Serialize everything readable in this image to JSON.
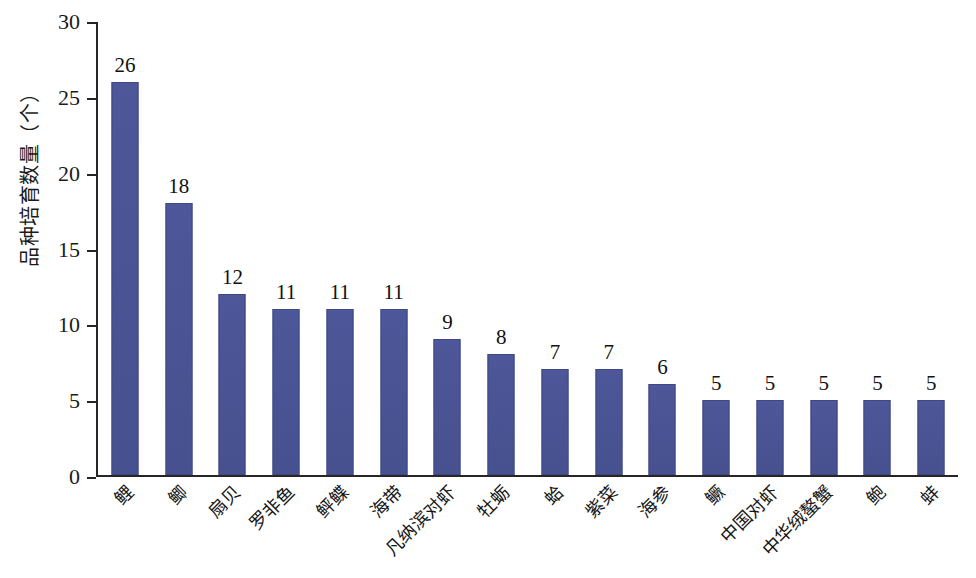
{
  "chart_data": {
    "type": "bar",
    "title": "",
    "subtitle": "",
    "xlabel": "",
    "ylabel": "品种培育数量（个）",
    "ylim": [
      0,
      30
    ],
    "ytick_labels": [
      "0",
      "5",
      "10",
      "15",
      "20",
      "25",
      "30"
    ],
    "ytick_values": [
      0,
      5,
      10,
      15,
      20,
      25,
      30
    ],
    "grid": false,
    "legend": false,
    "legend_position": "none",
    "bar_color": "#4a5494",
    "axis_color": "#262626",
    "background_color": "#ffffff",
    "categories": [
      "鲤",
      "鲫",
      "扇贝",
      "罗非鱼",
      "鲆鲽",
      "海带",
      "凡纳滨对虾",
      "牡蛎",
      "蛤",
      "紫菜",
      "海参",
      "鳜",
      "中国对虾",
      "中华绒螯蟹",
      "鲍",
      "蚌"
    ],
    "values": [
      26,
      18,
      12,
      11,
      11,
      11,
      9,
      8,
      7,
      7,
      6,
      5,
      5,
      5,
      5,
      5
    ],
    "data_labels": [
      "26",
      "18",
      "12",
      "11",
      "11",
      "11",
      "9",
      "8",
      "7",
      "7",
      "6",
      "5",
      "5",
      "5",
      "5",
      "5"
    ]
  }
}
